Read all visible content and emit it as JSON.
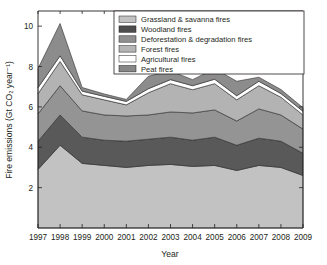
{
  "chart_data": {
    "type": "area",
    "stacked": true,
    "title": "",
    "xlabel": "Year",
    "ylabel": "Fire emissions (Gt CO₂ year⁻¹)",
    "x": [
      1997,
      1998,
      1999,
      2000,
      2001,
      2002,
      2003,
      2004,
      2005,
      2006,
      2007,
      2008,
      2009
    ],
    "xtick_labels": [
      "1997",
      "1998",
      "1999",
      "2000",
      "2001",
      "2002",
      "2003",
      "2004",
      "2005",
      "2006",
      "2007",
      "2008",
      "2009"
    ],
    "ytick_labels": [
      "2",
      "4",
      "6",
      "8",
      "10"
    ],
    "ytick_values": [
      2,
      4,
      6,
      8,
      10
    ],
    "xlim": [
      1997,
      2009
    ],
    "ylim": [
      0,
      10.75
    ],
    "grid": false,
    "legend_position": "top-center",
    "series": [
      {
        "name": "Agricultural fires",
        "color": "#ffffff",
        "stack_order": 5,
        "values": [
          0.3,
          0.28,
          0.18,
          0.17,
          0.17,
          0.2,
          0.2,
          0.2,
          0.22,
          0.2,
          0.22,
          0.18,
          0.18
        ]
      },
      {
        "name": "Peat fires",
        "color": "#8c8c8c",
        "stack_order": 6,
        "values": [
          0.95,
          1.6,
          0.18,
          0.12,
          0.1,
          0.62,
          0.43,
          0.3,
          0.52,
          0.72,
          0.2,
          0.2,
          0.18
        ]
      },
      {
        "name": "Forest fires",
        "color": "#b3b3b3",
        "stack_order": 4,
        "values": [
          1.0,
          1.2,
          0.8,
          0.75,
          0.55,
          1.1,
          1.4,
          1.15,
          1.3,
          1.05,
          1.15,
          0.88,
          0.7
        ]
      },
      {
        "name": "Deforestation & degradation fires",
        "color": "#949494",
        "stack_order": 3,
        "values": [
          1.35,
          1.45,
          1.3,
          1.25,
          1.25,
          1.2,
          1.25,
          1.35,
          1.35,
          1.2,
          1.45,
          1.3,
          1.2
        ]
      },
      {
        "name": "Woodland fires",
        "color": "#595959",
        "stack_order": 2,
        "values": [
          1.4,
          1.5,
          1.3,
          1.25,
          1.3,
          1.3,
          1.35,
          1.3,
          1.4,
          1.25,
          1.35,
          1.3,
          1.1
        ]
      },
      {
        "name": "Grassland & savanna fires",
        "color": "#c2c2c2",
        "stack_order": 1,
        "values": [
          2.9,
          4.1,
          3.2,
          3.1,
          3.0,
          3.1,
          3.15,
          3.05,
          3.1,
          2.85,
          3.1,
          3.0,
          2.6
        ]
      }
    ],
    "stack_sequence": [
      "Grassland & savanna fires",
      "Woodland fires",
      "Deforestation & degradation fires",
      "Forest fires",
      "Agricultural fires",
      "Peat fires"
    ],
    "totals": [
      7.9,
      10.13,
      6.96,
      6.64,
      6.37,
      7.52,
      7.78,
      7.35,
      7.89,
      7.27,
      7.47,
      6.86,
      5.96
    ]
  },
  "legend": {
    "entries": [
      {
        "label": "Grassland & savanna fires",
        "color": "#c2c2c2"
      },
      {
        "label": "Woodland fires",
        "color": "#4d4d4d"
      },
      {
        "label": "Deforestation & degradation fires",
        "color": "#8f8f8f"
      },
      {
        "label": "Forest fires",
        "color": "#b5b5b5"
      },
      {
        "label": "Agricultural fires",
        "color": "#ffffff"
      },
      {
        "label": "Peat fires",
        "color": "#878787"
      }
    ]
  },
  "axes": {
    "y_title": "Fire emissions (Gt CO₂ year⁻¹)",
    "x_title": "Year"
  }
}
